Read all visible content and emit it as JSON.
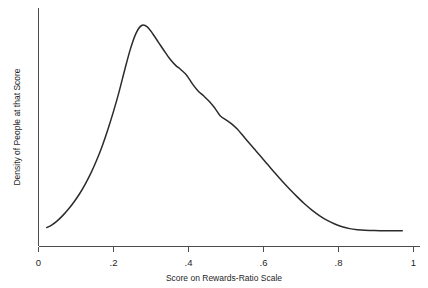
{
  "chart_data": {
    "type": "line",
    "title": "",
    "xlabel": "Score on Rewards-Ratio Scale",
    "ylabel": "Density of People at that Score",
    "xlim": [
      0,
      1
    ],
    "ylim": [
      0,
      1.05
    ],
    "grid": false,
    "legend": null,
    "xticks": [
      {
        "value": 0,
        "label": "0"
      },
      {
        "value": 0.2,
        "label": ".2"
      },
      {
        "value": 0.4,
        "label": ".4"
      },
      {
        "value": 0.6,
        "label": ".6"
      },
      {
        "value": 0.8,
        "label": ".8"
      },
      {
        "value": 1,
        "label": "1"
      }
    ],
    "yticks": [],
    "series": [
      {
        "name": "Density of People at that Score",
        "color": "#2b2b2b",
        "x": [
          0.022,
          0.035,
          0.05,
          0.065,
          0.08,
          0.095,
          0.11,
          0.125,
          0.14,
          0.155,
          0.17,
          0.185,
          0.2,
          0.215,
          0.23,
          0.245,
          0.26,
          0.275,
          0.29,
          0.305,
          0.32,
          0.335,
          0.35,
          0.365,
          0.38,
          0.395,
          0.41,
          0.425,
          0.44,
          0.455,
          0.47,
          0.485,
          0.5,
          0.515,
          0.53,
          0.545,
          0.56,
          0.575,
          0.59,
          0.61,
          0.63,
          0.65,
          0.67,
          0.69,
          0.71,
          0.73,
          0.75,
          0.77,
          0.79,
          0.81,
          0.83,
          0.85,
          0.87,
          0.89,
          0.91,
          0.93,
          0.95,
          0.97
        ],
        "y": [
          0.04,
          0.052,
          0.072,
          0.098,
          0.128,
          0.163,
          0.202,
          0.248,
          0.3,
          0.36,
          0.428,
          0.506,
          0.592,
          0.686,
          0.79,
          0.888,
          0.963,
          1.0,
          0.994,
          0.96,
          0.92,
          0.88,
          0.842,
          0.812,
          0.79,
          0.764,
          0.724,
          0.69,
          0.666,
          0.64,
          0.608,
          0.57,
          0.552,
          0.533,
          0.508,
          0.477,
          0.445,
          0.414,
          0.384,
          0.342,
          0.3,
          0.26,
          0.222,
          0.186,
          0.152,
          0.122,
          0.096,
          0.074,
          0.057,
          0.044,
          0.035,
          0.03,
          0.027,
          0.026,
          0.025,
          0.025,
          0.025,
          0.025
        ]
      }
    ]
  },
  "axes": {
    "x_axis_name": "x-axis",
    "y_axis_name": "y-axis"
  }
}
